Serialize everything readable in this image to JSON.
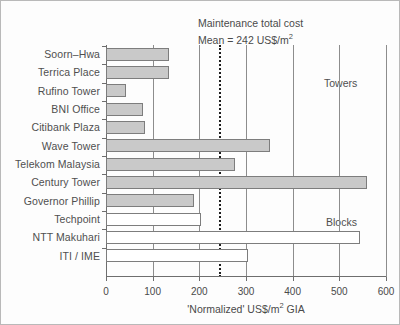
{
  "chart_data": {
    "type": "bar",
    "orientation": "horizontal",
    "title": "",
    "xlabel": "'Normalized' US$/m2 GIA",
    "xlabel_parts": {
      "main": "'Normalized' US$/m",
      "sup": "2",
      "tail": " GIA"
    },
    "ylabel": "",
    "xlim": [
      0,
      600
    ],
    "xticks": [
      0,
      100,
      200,
      300,
      400,
      500,
      600
    ],
    "xticklabels": [
      "0",
      "100",
      "200",
      "300",
      "400",
      "500",
      "600"
    ],
    "grid": true,
    "categories": [
      "Soorn–Hwa",
      "Terrica Place",
      "Rufino Tower",
      "BNI Office",
      "Citibank Plaza",
      "Wave Tower",
      "Telekom Malaysia",
      "Century Tower",
      "Governor Phillip",
      "Techpoint",
      "NTT Makuhari",
      "ITI / IME"
    ],
    "values": [
      136,
      136,
      42,
      80,
      84,
      352,
      276,
      560,
      188,
      203,
      545,
      305
    ],
    "groups": [
      "Towers",
      "Towers",
      "Towers",
      "Towers",
      "Towers",
      "Towers",
      "Towers",
      "Towers",
      "Towers",
      "Blocks",
      "Blocks",
      "Blocks"
    ],
    "group_labels": [
      "Towers",
      "Blocks"
    ],
    "series": [
      {
        "name": "Towers",
        "style": "filled-grey",
        "color": "#c9c9c9",
        "items": [
          {
            "category": "Soorn–Hwa",
            "value": 136
          },
          {
            "category": "Terrica Place",
            "value": 136
          },
          {
            "category": "Rufino Tower",
            "value": 42
          },
          {
            "category": "BNI Office",
            "value": 80
          },
          {
            "category": "Citibank Plaza",
            "value": 84
          },
          {
            "category": "Wave Tower",
            "value": 352
          },
          {
            "category": "Telekom Malaysia",
            "value": 276
          },
          {
            "category": "Century Tower",
            "value": 560
          },
          {
            "category": "Governor Phillip",
            "value": 188
          }
        ]
      },
      {
        "name": "Blocks",
        "style": "open-white",
        "color": "#ffffff",
        "items": [
          {
            "category": "Techpoint",
            "value": 203
          },
          {
            "category": "NTT Makuhari",
            "value": 545
          },
          {
            "category": "ITI / IME",
            "value": 305
          }
        ]
      }
    ],
    "annotations": [
      {
        "name": "mean-reference-line",
        "value": 242,
        "style": "dotted-vertical",
        "text_line1": "Maintenance total cost",
        "text_line2_prefix": "Mean = 242 US$/m",
        "text_line2_sup": "2"
      }
    ]
  },
  "mean_note": {
    "line1": "Maintenance total cost",
    "line2_prefix": "Mean = 242 US$/m",
    "line2_sup": "2"
  },
  "axis": {
    "title_main": "'Normalized' US$/m",
    "title_sup": "2",
    "title_tail": " GIA"
  },
  "group_labels": {
    "towers": "Towers",
    "blocks": "Blocks"
  }
}
